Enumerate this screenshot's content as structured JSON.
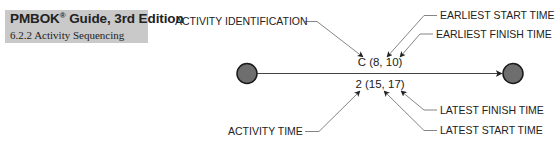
{
  "header": {
    "title_main": "PMBOK",
    "title_reg": "®",
    "title_rest": " Guide, 3rd Edition",
    "subtitle": "6.2.2 Activity Sequencing",
    "background_color": "#c9c9c9"
  },
  "diagram": {
    "activity_label": "C (8, 10)",
    "time_label": "2 (15, 17)",
    "start_node": "start-event-node",
    "end_node": "end-event-node",
    "node_fill": "#6e6e6e",
    "callouts": {
      "activity_identification": "ACTIVITY IDENTIFICATION",
      "earliest_start_time": "EARLIEST START TIME",
      "earliest_finish_time": "EARLIEST FINISH TIME",
      "latest_finish_time": "LATEST FINISH TIME",
      "latest_start_time": "LATEST START TIME",
      "activity_time": "ACTIVITY TIME"
    }
  }
}
